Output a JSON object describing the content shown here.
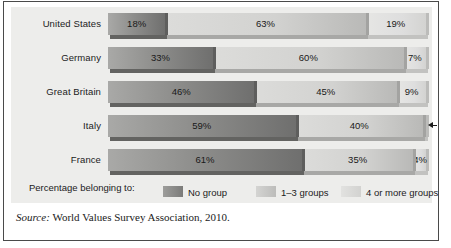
{
  "chart_data": {
    "type": "bar",
    "subtype": "stacked-horizontal-100",
    "title": "",
    "xlabel": "",
    "ylabel": "",
    "xlim": [
      0,
      100
    ],
    "grid": false,
    "legend_position": "bottom",
    "units": "percent",
    "categories": [
      "United States",
      "Germany",
      "Great Britain",
      "Italy",
      "France"
    ],
    "series": [
      {
        "name": "No group",
        "color": "#7b7b79",
        "values": [
          18,
          33,
          46,
          59,
          61
        ]
      },
      {
        "name": "1–3 groups",
        "color": "#c6c6c4",
        "values": [
          63,
          60,
          45,
          40,
          35
        ]
      },
      {
        "name": "4 or more groups",
        "color": "#dcdcda",
        "values": [
          19,
          7,
          9,
          1,
          4
        ]
      }
    ],
    "value_labels": [
      [
        "18%",
        "63%",
        "19%"
      ],
      [
        "33%",
        "60%",
        "7%"
      ],
      [
        "46%",
        "45%",
        "9%"
      ],
      [
        "59%",
        "40%",
        "1%"
      ],
      [
        "61%",
        "35%",
        "4%"
      ]
    ],
    "annotations": [
      {
        "row": "Italy",
        "series": "4 or more groups",
        "text": "1%",
        "style": "leader-arrow-outside"
      }
    ]
  },
  "rows": [
    {
      "label": "United States",
      "segments": [
        {
          "label": "18%",
          "value": 18,
          "tone": "dark",
          "outside": false
        },
        {
          "label": "63%",
          "value": 63,
          "tone": "mid",
          "outside": false
        },
        {
          "label": "19%",
          "value": 19,
          "tone": "light",
          "outside": false
        }
      ]
    },
    {
      "label": "Germany",
      "segments": [
        {
          "label": "33%",
          "value": 33,
          "tone": "dark",
          "outside": false
        },
        {
          "label": "60%",
          "value": 60,
          "tone": "mid",
          "outside": false
        },
        {
          "label": "7%",
          "value": 7,
          "tone": "light",
          "outside": false
        }
      ]
    },
    {
      "label": "Great Britain",
      "segments": [
        {
          "label": "46%",
          "value": 46,
          "tone": "dark",
          "outside": false
        },
        {
          "label": "45%",
          "value": 45,
          "tone": "mid",
          "outside": false
        },
        {
          "label": "9%",
          "value": 9,
          "tone": "light",
          "outside": false
        }
      ]
    },
    {
      "label": "Italy",
      "segments": [
        {
          "label": "59%",
          "value": 59,
          "tone": "dark",
          "outside": false
        },
        {
          "label": "40%",
          "value": 40,
          "tone": "mid",
          "outside": false
        },
        {
          "label": "1%",
          "value": 1,
          "tone": "light",
          "outside": true
        }
      ]
    },
    {
      "label": "France",
      "segments": [
        {
          "label": "61%",
          "value": 61,
          "tone": "dark",
          "outside": false
        },
        {
          "label": "35%",
          "value": 35,
          "tone": "mid",
          "outside": false
        },
        {
          "label": "4%",
          "value": 4,
          "tone": "light",
          "outside": false
        }
      ]
    }
  ],
  "legend": {
    "title": "Percentage belonging to:",
    "items": [
      {
        "label": "No group",
        "tone": "dark"
      },
      {
        "label": "1–3 groups",
        "tone": "mid"
      },
      {
        "label": "4 or more groups",
        "tone": "light"
      }
    ]
  },
  "source": {
    "prefix": "Source:",
    "text": "World Values Survey Association, 2010."
  }
}
